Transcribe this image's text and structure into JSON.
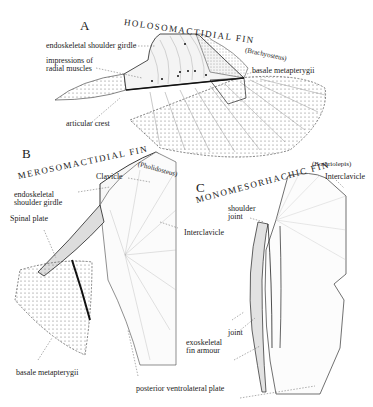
{
  "figure": {
    "panels": [
      {
        "letter": "A",
        "title": "HOLOSOMACTIDIAL FIN",
        "taxon": "(Brachyosteus)",
        "labels": {
          "shoulder_girdle": "endoskeletal shoulder girdle",
          "impressions_1": "impressions of",
          "impressions_2": "radial muscles",
          "basale": "basale metapterygii",
          "articular": "articular crest"
        }
      },
      {
        "letter": "B",
        "title": "MEROSOMACTIDIAL FIN",
        "taxon": "(Pholidosteus)",
        "labels": {
          "clavicle": "Clavicle",
          "girdle_1": "endoskeletal",
          "girdle_2": "shoulder girdle",
          "spinal": "Spinal plate",
          "interclavicle": "Interclavicle",
          "basale": "basale metapterygii"
        }
      },
      {
        "letter": "C",
        "title": "MONOMESORHACHIC FIN",
        "taxon": "(Bothriolepis)",
        "labels": {
          "interclavicle": "Interclavicle",
          "shoulder_1": "shoulder",
          "shoulder_2": "joint",
          "joint": "joint",
          "armour_1": "exoskeletal",
          "armour_2": "fin armour"
        }
      }
    ],
    "shared_labels": {
      "posterior": "posterior ventrolateral plate"
    }
  }
}
